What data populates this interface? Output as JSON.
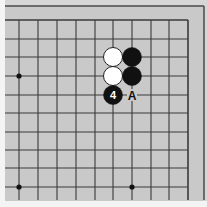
{
  "diagram": {
    "type": "go-board-corner",
    "colors": {
      "page_background": "#f4f4f4",
      "board": "#c9c9c9",
      "outer_margin": "#d6d6d6",
      "grid_line": "#3a3a3a",
      "border_line": "#4a4a4a",
      "star_point": "#111111",
      "black_stone": "#111111",
      "white_stone": "#ffffff",
      "white_stone_outline": "#222222",
      "label_on_black": "#ffffff",
      "label_on_board": "#111111"
    },
    "grid": {
      "x_lines": [
        19,
        38,
        57,
        76,
        95,
        113,
        132,
        151,
        169,
        188
      ],
      "y_lines": [
        20,
        39,
        57,
        76,
        95,
        113,
        132,
        150,
        168,
        187
      ],
      "line_x_start": 5,
      "line_y_end": 200
    },
    "border": {
      "top_y": 6,
      "right_x": 204,
      "left_x": 5
    },
    "star_points": [
      {
        "x": 19,
        "y": 76
      },
      {
        "x": 19,
        "y": 187
      },
      {
        "x": 132,
        "y": 187
      }
    ],
    "stones": [
      {
        "color": "white",
        "x": 113,
        "y": 57,
        "label": ""
      },
      {
        "color": "black",
        "x": 132,
        "y": 57,
        "label": ""
      },
      {
        "color": "white",
        "x": 113,
        "y": 76,
        "label": ""
      },
      {
        "color": "black",
        "x": 132,
        "y": 76,
        "label": ""
      },
      {
        "color": "black",
        "x": 113,
        "y": 95,
        "label": "4"
      }
    ],
    "point_labels": [
      {
        "text": "A",
        "x": 132,
        "y": 95
      }
    ],
    "stone_radius": 9.5
  }
}
